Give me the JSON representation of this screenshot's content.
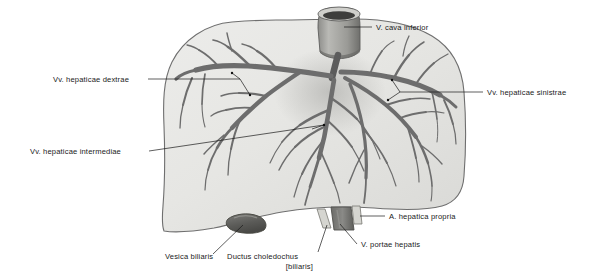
{
  "figure": {
    "background_color": "#ffffff",
    "organ_fill_color": "#e7e7e4",
    "organ_outline_color": "#6f6f6f",
    "vessel_color": "#6d6d6d",
    "vessel_dark_color": "#4a4a4a",
    "label_color": "#1a1a1a",
    "leader_color": "#1a1a1a"
  },
  "labels": [
    {
      "id": "v-cava-inferior",
      "text": "V. cava inferior",
      "text_x": 376,
      "text_y": 30,
      "anchor": "start",
      "leader": "M 344 27 L 372 27",
      "target": "vena-cava-stump"
    },
    {
      "id": "vv-hepaticae-dextrae",
      "text": "Vv. hepaticae dextrae",
      "text_x": 53,
      "text_y": 82,
      "anchor": "start",
      "leader": "M 148 79 L 240 79 M 240 79 L 232 73 M 240 79 L 250 95",
      "target": "right-hepatic-veins"
    },
    {
      "id": "vv-hepaticae-sinistrae",
      "text": "Vv. hepaticae sinistrae",
      "text_x": 487,
      "text_y": 95,
      "anchor": "start",
      "leader": "M 483 92 L 400 92 M 400 92 L 392 80 M 400 92 L 388 100",
      "target": "left-hepatic-veins"
    },
    {
      "id": "vv-hepaticae-intermediae",
      "text": "Vv. hepaticae intermediae",
      "text_x": 30,
      "text_y": 154,
      "anchor": "start",
      "leader": "M 149 151 L 324 125 M 324 125 L 312 129",
      "target": "intermediate-hepatic-veins"
    },
    {
      "id": "a-hepatica-propria",
      "text": "A. hepatica propria",
      "text_x": 389,
      "text_y": 219,
      "anchor": "start",
      "leader": "M 385 216 L 360 216",
      "target": "hepatic-artery-stump"
    },
    {
      "id": "v-portae-hepatis",
      "text": "V. portae hepatis",
      "text_x": 361,
      "text_y": 247,
      "anchor": "start",
      "leader": "M 357 244 L 340 224",
      "target": "portal-vein-stump"
    },
    {
      "id": "vesica-biliaris",
      "text": "Vesica biliaris",
      "text_x": 165,
      "text_y": 259,
      "anchor": "start",
      "leader": "M 213 254 L 243 225",
      "target": "gallbladder"
    },
    {
      "id": "ductus-choledochus",
      "text": "Ductus choledochus",
      "text_x": 227,
      "text_y": 259,
      "anchor": "start",
      "leader": "M 318 252 L 327 225",
      "target": "bile-duct-stump"
    },
    {
      "id": "ductus-choledochus-line2",
      "text": "[biliaris]",
      "text_x": 313,
      "text_y": 269,
      "anchor": "end",
      "leader": "",
      "target": "bile-duct-stump"
    }
  ],
  "structures": [
    {
      "id": "liver-body",
      "name": "liver",
      "description": "Large gray hepatic mass occupying the centre of the figure"
    },
    {
      "id": "vena-cava-stump",
      "name": "inferior vena cava",
      "description": "Cut cylindrical venous stump at the superior border"
    },
    {
      "id": "gallbladder",
      "name": "vesica biliaris",
      "description": "Dark rounded gallbladder fundus at inferior border"
    },
    {
      "id": "bile-duct-stump",
      "name": "ductus choledochus",
      "description": "Thin pale tube, left of the portal vein"
    },
    {
      "id": "portal-vein-stump",
      "name": "vena portae hepatis",
      "description": "Broad dark tube at the porta hepatis"
    },
    {
      "id": "hepatic-artery-stump",
      "name": "arteria hepatica propria",
      "description": "Thin pale tube right of the portal vein"
    },
    {
      "id": "right-hepatic-veins",
      "name": "venae hepaticae dextrae",
      "description": "Branching venous tree in the right lobe"
    },
    {
      "id": "intermediate-hepatic-veins",
      "name": "venae hepaticae intermediae",
      "description": "Central branching venous tree"
    },
    {
      "id": "left-hepatic-veins",
      "name": "venae hepaticae sinistrae",
      "description": "Branching venous tree in the left lobe"
    }
  ]
}
